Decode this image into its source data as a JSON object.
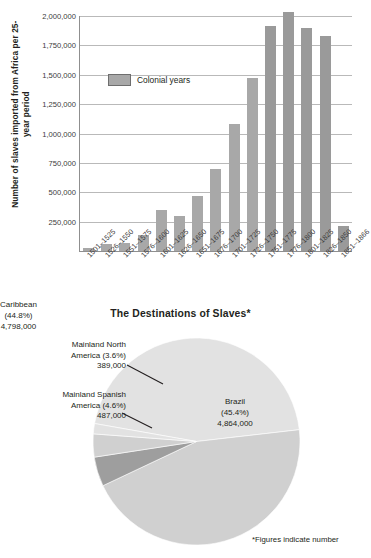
{
  "bar_chart": {
    "ylabel": "Number of slaves imported from Africa per 25-year period",
    "legend_label": "Colonial years",
    "yticks": [
      "2,000,000",
      "1,750,000",
      "1,500,000",
      "1,250,000",
      "1,000,000",
      "750,000",
      "500,000",
      "250,000"
    ]
  },
  "pie_chart": {
    "title": "The Destinations of Slaves*",
    "callouts": {
      "mainland_north_america": "Mainland North\nAmerica (3.6%)\n389,000",
      "mainland_spanish_america": "Mainland Spanish\nAmerica (4.6%)\n487,000"
    },
    "inlabels": {
      "brazil": "Brazil\n(45.4%)\n4,864,000",
      "caribbean": "Caribbean\n(44.8%)\n4,798,000"
    }
  },
  "footnote": "*Figures indicate number",
  "colors": {
    "bar_fill": "#a8a8a8",
    "bar_fill_colonial": "#9a9a9a",
    "axis": "#8f8f8f",
    "gridline": "#b9b9b9",
    "pie_large": "#e2e2e2",
    "pie_medium": "#d0d0d0",
    "pie_dark": "#9e9e9e",
    "text": "#231f20"
  },
  "chart_data": [
    {
      "type": "bar",
      "title": "",
      "xlabel": "",
      "ylabel": "Number of slaves imported from Africa per 25-year period",
      "ylim": [
        0,
        2000000
      ],
      "ytick_values": [
        250000,
        500000,
        750000,
        1000000,
        1250000,
        1500000,
        1750000,
        2000000
      ],
      "grid": true,
      "legend": [
        "Colonial years"
      ],
      "legend_position": "inside-upper-left",
      "categories": [
        "1501-1525",
        "1526-1550",
        "1551-1575",
        "1576-1600",
        "1601-1625",
        "1626-1650",
        "1651-1675",
        "1676-1700",
        "1701-1725",
        "1726-1750",
        "1751-1775",
        "1776-1800",
        "1801-1825",
        "1826-1850",
        "1851-1866"
      ],
      "values": [
        28000,
        56000,
        64000,
        135000,
        350000,
        300000,
        465000,
        700000,
        1085000,
        1470000,
        1915000,
        2030000,
        1900000,
        1830000,
        215000
      ],
      "colonial_flags": [
        false,
        false,
        false,
        false,
        false,
        false,
        false,
        false,
        false,
        false,
        true,
        true,
        true,
        true,
        true
      ]
    },
    {
      "type": "pie",
      "title": "The Destinations of Slaves*",
      "labels": [
        "Brazil",
        "Caribbean",
        "Mainland Spanish America",
        "Mainland North America",
        "Other"
      ],
      "percentages": [
        45.4,
        44.8,
        4.6,
        3.6,
        1.6
      ],
      "values": [
        4864000,
        4798000,
        487000,
        389000,
        171000
      ],
      "annotations": [
        "Brazil (45.4%) 4,864,000",
        "Caribbean (44.8%) 4,798,000",
        "Mainland Spanish America (4.6%) 487,000",
        "Mainland North America (3.6%) 389,000"
      ],
      "footnote": "*Figures indicate number"
    }
  ]
}
